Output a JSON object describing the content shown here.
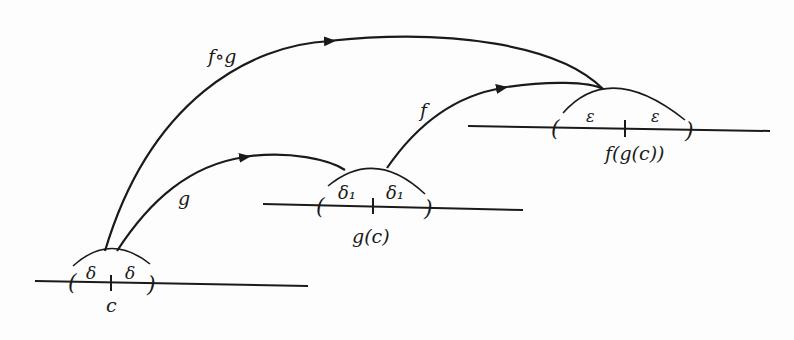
{
  "diagram": {
    "colors": {
      "ink": "#1a1a1a",
      "background": "#fdfdfd"
    },
    "number_lines": [
      {
        "id": "domain",
        "point_label": "c",
        "radius_label": "δ"
      },
      {
        "id": "middle",
        "point_label": "g(c)",
        "radius_label": "δ₁"
      },
      {
        "id": "codomain",
        "point_label": "f(g(c))",
        "radius_label": "ε"
      }
    ],
    "arrows": [
      {
        "id": "composite",
        "label": "f∘g",
        "from": "c",
        "to": "f(g(c))"
      },
      {
        "id": "g",
        "label": "g",
        "from": "c",
        "to": "g(c)"
      },
      {
        "id": "f",
        "label": "f",
        "from": "g(c)",
        "to": "f(g(c))"
      }
    ],
    "paren_open": "(",
    "paren_close": ")"
  }
}
